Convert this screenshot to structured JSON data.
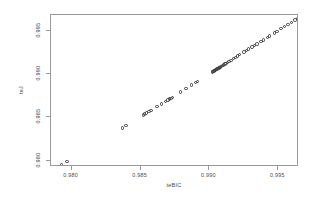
{
  "chart_data": {
    "type": "scatter",
    "title": "",
    "xlabel": "teBIC",
    "ylabel": "teJ",
    "xlim": [
      0.9785,
      0.9965
    ],
    "ylim": [
      0.9793,
      0.9968
    ],
    "xticks": [
      0.98,
      0.985,
      0.99,
      0.995
    ],
    "xticklabels": [
      "0.980",
      "0.985",
      "0.990",
      "0.995"
    ],
    "yticks": [
      0.98,
      0.985,
      0.99,
      0.995
    ],
    "yticklabels": [
      "0.980",
      "0.985",
      "0.990",
      "0.995"
    ],
    "grid": false,
    "legend": false,
    "marker": "open-circle",
    "marker_color": "#3a3a3a",
    "frame_color": "#9a9a9a",
    "n_points": 63,
    "series": [
      {
        "name": "teJ vs teBIC",
        "x": [
          0.97925,
          0.97965,
          0.9837,
          0.98395,
          0.9852,
          0.9853,
          0.98545,
          0.9856,
          0.98575,
          0.9862,
          0.9865,
          0.9868,
          0.987,
          0.9871,
          0.9872,
          0.9873,
          0.9879,
          0.9883,
          0.9887,
          0.989,
          0.98915,
          0.9902,
          0.99025,
          0.99032,
          0.99038,
          0.99044,
          0.9905,
          0.99056,
          0.99062,
          0.99068,
          0.99074,
          0.9908,
          0.99088,
          0.99096,
          0.99104,
          0.99112,
          0.9912,
          0.9913,
          0.99142,
          0.99155,
          0.99175,
          0.9919,
          0.99205,
          0.9922,
          0.9925,
          0.99268,
          0.99285,
          0.9931,
          0.99328,
          0.99345,
          0.99375,
          0.99392,
          0.9942,
          0.99438,
          0.9947,
          0.9949,
          0.9952,
          0.99545,
          0.9957,
          0.99595,
          0.9962,
          0.9964,
          0.99655
        ],
        "y": [
          0.97955,
          0.9799,
          0.9838,
          0.98405,
          0.9853,
          0.9854,
          0.98552,
          0.98566,
          0.9858,
          0.98625,
          0.98655,
          0.98682,
          0.98702,
          0.98712,
          0.98722,
          0.98732,
          0.98792,
          0.98832,
          0.98872,
          0.98902,
          0.98918,
          0.99022,
          0.99028,
          0.99034,
          0.9904,
          0.99046,
          0.99052,
          0.99058,
          0.99064,
          0.9907,
          0.99076,
          0.99082,
          0.9909,
          0.99098,
          0.99106,
          0.99114,
          0.99122,
          0.99132,
          0.99144,
          0.99157,
          0.99177,
          0.99192,
          0.99207,
          0.99222,
          0.99252,
          0.9927,
          0.99287,
          0.99312,
          0.9933,
          0.99347,
          0.99377,
          0.99394,
          0.99422,
          0.9944,
          0.99472,
          0.99492,
          0.99522,
          0.99547,
          0.99572,
          0.99597,
          0.99622,
          0.99642,
          0.99658
        ]
      }
    ]
  }
}
